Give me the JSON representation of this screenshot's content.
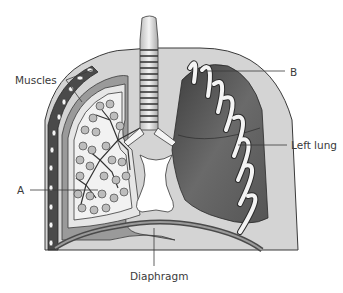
{
  "diagram": {
    "labels": {
      "muscles": "Muscles",
      "b": "B",
      "left_lung": "Left lung",
      "a": "A",
      "diaphragm": "Diaphragm"
    },
    "parts": [
      "trachea",
      "bronchi",
      "right lung with bronchioles and alveoli",
      "left lung",
      "ribs",
      "intercostal muscles",
      "pleural membranes",
      "heart space",
      "diaphragm"
    ],
    "colors": {
      "outline": "#3a3a3a",
      "lung_dark": "#5a5a5a",
      "lung_light": "#cfcfcf",
      "tissue_light": "#e2e2e2",
      "rib": "#f4f4f4",
      "muscle_dark": "#4a4a4a"
    }
  }
}
